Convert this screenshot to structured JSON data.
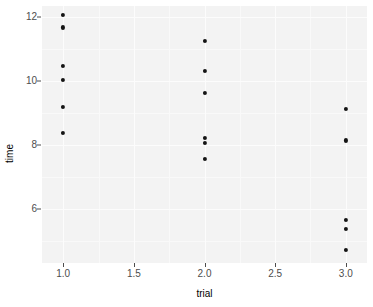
{
  "chart_data": {
    "type": "scatter",
    "title": "",
    "xlabel": "trial",
    "ylabel": "time",
    "xlim": [
      0.85,
      3.15
    ],
    "ylim": [
      4.3,
      12.35
    ],
    "grid": true,
    "legend": null,
    "x_ticks": [
      {
        "value": 1.0,
        "label": "1.0"
      },
      {
        "value": 1.5,
        "label": "1.5"
      },
      {
        "value": 2.0,
        "label": "2.0"
      },
      {
        "value": 2.5,
        "label": "2.5"
      },
      {
        "value": 3.0,
        "label": "3.0"
      }
    ],
    "x_minor_ticks": [
      1.25,
      1.75,
      2.25,
      2.75
    ],
    "y_ticks": [
      {
        "value": 12,
        "label": "12"
      },
      {
        "value": 10,
        "label": "10"
      },
      {
        "value": 8,
        "label": "8"
      },
      {
        "value": 6,
        "label": "6"
      }
    ],
    "y_minor_ticks": [
      11,
      9,
      7,
      5
    ],
    "points": [
      {
        "x": 1.0,
        "y": 12.07
      },
      {
        "x": 1.0,
        "y": 11.68
      },
      {
        "x": 1.0,
        "y": 10.47
      },
      {
        "x": 1.0,
        "y": 10.04
      },
      {
        "x": 1.0,
        "y": 9.19
      },
      {
        "x": 1.0,
        "y": 8.37
      },
      {
        "x": 2.0,
        "y": 11.25
      },
      {
        "x": 2.0,
        "y": 10.31
      },
      {
        "x": 2.0,
        "y": 9.62
      },
      {
        "x": 2.0,
        "y": 8.22
      },
      {
        "x": 2.0,
        "y": 8.06
      },
      {
        "x": 2.0,
        "y": 7.57
      },
      {
        "x": 3.0,
        "y": 9.12
      },
      {
        "x": 3.0,
        "y": 8.14
      },
      {
        "x": 3.0,
        "y": 5.66
      },
      {
        "x": 3.0,
        "y": 5.37
      },
      {
        "x": 3.0,
        "y": 4.72
      }
    ],
    "colors": {
      "point": "#141414",
      "panel_background": "#f3f3f3",
      "grid_major": "#fcfcfc",
      "grid_minor": "#f9f9f9",
      "tick_label": "#4d4d4d",
      "axis_title": "#000000",
      "plot_background": "#ffffff"
    }
  }
}
